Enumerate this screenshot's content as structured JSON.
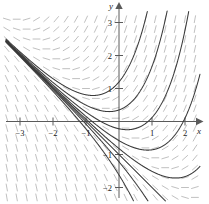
{
  "figure": {
    "title": "",
    "background_color": "#ffffff",
    "axis_color": "#4a4a4a",
    "curve_color": "#3a3a3a",
    "slope_field_color": "#b9b9b9"
  },
  "axes": {
    "x_axis_label": "x",
    "y_axis_label": "y",
    "x_ticks": [
      {
        "value": -3,
        "label": "−3"
      },
      {
        "value": -2,
        "label": "−2"
      },
      {
        "value": -1,
        "label": "−1"
      },
      {
        "value": 1,
        "label": "1"
      },
      {
        "value": 2,
        "label": "2"
      }
    ],
    "y_ticks": [
      {
        "value": 3,
        "label": "3"
      },
      {
        "value": 2,
        "label": "2"
      },
      {
        "value": 1,
        "label": "1"
      },
      {
        "value": -1,
        "label": "−1"
      },
      {
        "value": -2,
        "label": "−2"
      }
    ],
    "xlim": [
      -3.6,
      2.7
    ],
    "ylim": [
      -2.45,
      3.35
    ],
    "grid": false
  },
  "chart_data": {
    "type": "line",
    "title": "",
    "xlabel": "x",
    "ylabel": "y",
    "xlim": [
      -3.6,
      2.7
    ],
    "ylim": [
      -2.45,
      3.35
    ],
    "grid": false,
    "legend": "none",
    "plot_kind": "slope-field-with-solution-curves",
    "slope_field": {
      "description": "Dashed tick marks showing dy/dx direction at grid points",
      "color": "#b9b9b9",
      "dash_length": 7,
      "x_start": -3.4,
      "x_end": 2.55,
      "x_step": 0.3,
      "y_start": -2.3,
      "y_end": 3.2,
      "y_step": 0.3,
      "slope_formula": "x + y"
    },
    "solution_curves": {
      "description": "Family of solutions y = C*exp(x) - x - 1 of dy/dx = x + y; all drawn from a common node near (-3, -2)",
      "color": "#3a3a3a",
      "formula": "y = C*e^x - x - 1",
      "constants": [
        2.2,
        1.35,
        0.78,
        0.42,
        0.18,
        0.0,
        -0.22,
        -0.62
      ],
      "separatrix_constant": 0,
      "node_point": [
        -3,
        -2
      ],
      "y_intercepts": [
        1.2,
        0.35,
        -0.22,
        -0.58,
        -0.82,
        -1.0,
        -1.22,
        -1.62
      ]
    },
    "x_data_range": [
      -3.45,
      2.6
    ],
    "series": [
      {
        "name": "curve-1",
        "C": 2.2
      },
      {
        "name": "curve-2",
        "C": 1.35
      },
      {
        "name": "curve-3",
        "C": 0.78
      },
      {
        "name": "curve-4",
        "C": 0.42
      },
      {
        "name": "curve-5",
        "C": 0.18
      },
      {
        "name": "curve-separatrix",
        "C": 0.0
      },
      {
        "name": "curve-6",
        "C": -0.22
      },
      {
        "name": "curve-7",
        "C": -0.62
      }
    ]
  }
}
